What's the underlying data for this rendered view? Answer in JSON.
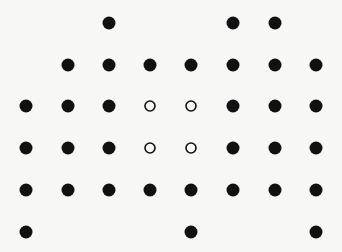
{
  "diagram": {
    "type": "dot-lattice",
    "colors": {
      "background": "#f7f7f5",
      "filled": "#111111",
      "open_stroke": "#111111",
      "open_fill": "#f7f7f5"
    },
    "grid": {
      "columns_x": [
        26,
        68,
        109,
        150,
        191,
        233,
        275,
        316
      ],
      "rows_y": [
        23,
        65,
        106,
        148,
        190,
        232
      ],
      "filled_radius": 6.5,
      "open_radius": 5,
      "open_stroke_width": 1.6
    },
    "rows": [
      {
        "row": 0,
        "cells": [
          "",
          "",
          "filled",
          "",
          "",
          "filled",
          "filled",
          ""
        ]
      },
      {
        "row": 1,
        "cells": [
          "",
          "filled",
          "filled",
          "filled",
          "filled",
          "filled",
          "filled",
          "filled"
        ]
      },
      {
        "row": 2,
        "cells": [
          "filled",
          "filled",
          "filled",
          "open",
          "open",
          "filled",
          "filled",
          "filled"
        ]
      },
      {
        "row": 3,
        "cells": [
          "filled",
          "filled",
          "filled",
          "open",
          "open",
          "filled",
          "filled",
          "filled"
        ]
      },
      {
        "row": 4,
        "cells": [
          "filled",
          "filled",
          "filled",
          "filled",
          "filled",
          "filled",
          "filled",
          "filled"
        ]
      },
      {
        "row": 5,
        "cells": [
          "filled",
          "",
          "",
          "",
          "filled",
          "",
          "",
          "filled"
        ]
      }
    ]
  }
}
